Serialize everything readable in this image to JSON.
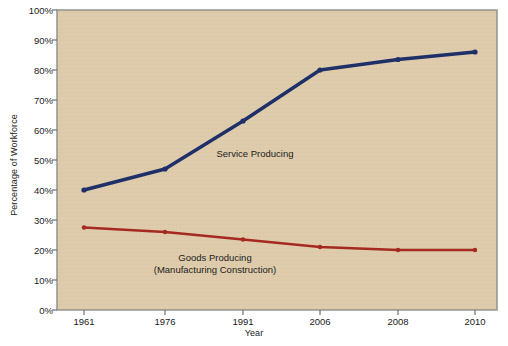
{
  "chart_data": {
    "type": "line",
    "title": "",
    "xlabel": "Year",
    "ylabel": "Percentage of Workforce",
    "categories": [
      "1961",
      "1976",
      "1991",
      "2006",
      "2008",
      "2010"
    ],
    "x_positions": [
      84,
      165,
      243,
      320,
      398,
      475
    ],
    "ylim": [
      0,
      100
    ],
    "y_ticks": [
      "0%",
      "10%",
      "20%",
      "30%",
      "40%",
      "50%",
      "60%",
      "70%",
      "80%",
      "90%",
      "100%"
    ],
    "y_tick_values": [
      0,
      10,
      20,
      30,
      40,
      50,
      60,
      70,
      80,
      90,
      100
    ],
    "grid": false,
    "legend_position": "inline-annotation",
    "series": [
      {
        "name": "Service Producing",
        "color": "#1f3068",
        "values": [
          40,
          47,
          63,
          80,
          83.5,
          86
        ],
        "label_lines": [
          "Service Producing"
        ],
        "label_x": 255,
        "label_y": 148
      },
      {
        "name": "Goods Producing (Manufacturing Construction)",
        "color": "#a52920",
        "values": [
          27.5,
          26,
          23.5,
          21,
          20,
          20
        ],
        "label_lines": [
          "Goods Producing",
          "(Manufacturing Construction)"
        ],
        "label_x": 215,
        "label_y": 252
      }
    ]
  },
  "style": {
    "plot_background": "#ddcbab",
    "plot_border": "#8d8d8d",
    "axis_color": "#6e6e6e",
    "text_color": "#1c1c1c",
    "page_background": "#ffffff"
  },
  "plot_area": {
    "left": 57,
    "top": 10,
    "right": 497,
    "bottom": 310
  }
}
